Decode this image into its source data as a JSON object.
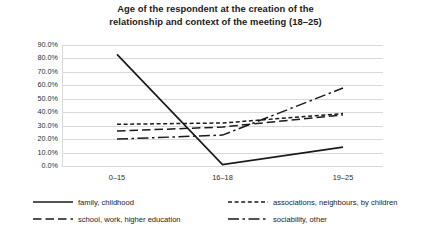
{
  "chart_data": {
    "type": "line",
    "title": "Age of the respondent at the creation of the relationship and context of the meeting (18–25)",
    "title_line_1": "Age of the respondent at the creation of the",
    "title_line_2": "relationship and context of the meeting (18–25)",
    "xlabel": "",
    "ylabel": "",
    "categories": [
      "0–15",
      "16–18",
      "19–25"
    ],
    "ylim": [
      0,
      90
    ],
    "ytick_labels": [
      "0.0%",
      "10.0%",
      "20.0%",
      "30.0%",
      "40.0%",
      "50.0%",
      "60.0%",
      "70.0%",
      "80.0%",
      "90.0%"
    ],
    "ytick_values": [
      0,
      10,
      20,
      30,
      40,
      50,
      60,
      70,
      80,
      90
    ],
    "grid": true,
    "legend_position": "bottom",
    "series": [
      {
        "name": "family, childhood",
        "style": "solid",
        "color": "#1a1a1a",
        "values": [
          83.0,
          1.0,
          14.0
        ]
      },
      {
        "name": "associations, neighbours, by children",
        "style": "short-dash",
        "color": "#1a1a1a",
        "values": [
          31.0,
          32.0,
          39.0
        ]
      },
      {
        "name": "school, work, higher education",
        "style": "long-dash",
        "color": "#1a1a1a",
        "values": [
          26.0,
          29.0,
          38.0
        ]
      },
      {
        "name": "sociability, other",
        "style": "dash-dot",
        "color": "#1a1a1a",
        "values": [
          20.0,
          23.0,
          58.0
        ]
      }
    ]
  },
  "legend": {
    "items": [
      {
        "label": "family, childhood",
        "style": "solid"
      },
      {
        "label": "associations, neighbours, by children",
        "style": "short-dash"
      },
      {
        "label": "school, work, higher education",
        "style": "long-dash"
      },
      {
        "label": "sociability, other",
        "style": "dash-dot"
      }
    ]
  }
}
